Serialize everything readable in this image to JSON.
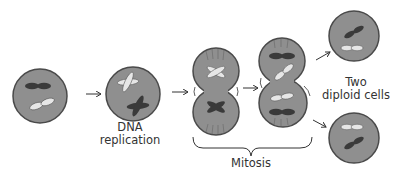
{
  "diagram": {
    "colors": {
      "cell_fill": "#8f8f8f",
      "cell_stroke": "#4a4a4a",
      "chromosome_dark": "#3a3a3a",
      "chromosome_light": "#e6e6e6",
      "arrow": "#333333",
      "text": "#333333"
    },
    "stages": [
      {
        "id": "parent-cell",
        "label": ""
      },
      {
        "id": "replicated-cell",
        "label": "DNA replication"
      },
      {
        "id": "metaphase-cell",
        "label": ""
      },
      {
        "id": "anaphase-cell",
        "label": ""
      },
      {
        "id": "daughter-cell-top",
        "label": ""
      },
      {
        "id": "daughter-cell-bottom",
        "label": ""
      }
    ],
    "labels": {
      "dna_line1": "DNA",
      "dna_line2": "replication",
      "mitosis": "Mitosis",
      "two_line1": "Two",
      "two_line2": "diploid cells"
    }
  }
}
